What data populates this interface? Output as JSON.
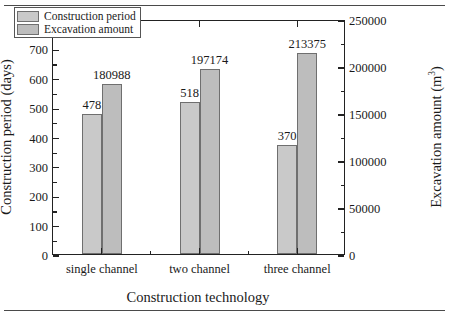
{
  "chart_data": {
    "type": "bar",
    "title": "",
    "xlabel": "Construction technology",
    "categories": [
      "single channel",
      "two channel",
      "three channel"
    ],
    "series": [
      {
        "name": "Construction period",
        "unit": "days",
        "axis": "left",
        "color": "#c9c9c9",
        "values": [
          478,
          518,
          370
        ],
        "labels": [
          "478",
          "518",
          "370"
        ]
      },
      {
        "name": "Excavation amount",
        "unit": "m3",
        "axis": "right",
        "color": "#bdbdbd",
        "values": [
          180988,
          197174,
          213375
        ],
        "labels": [
          "180988",
          "197174",
          "213375"
        ]
      }
    ],
    "left_axis": {
      "label": "Construction period (days)",
      "ylim": [
        0,
        800
      ],
      "ticks": [
        0,
        100,
        200,
        300,
        400,
        500,
        600,
        700,
        800
      ],
      "tick_labels": [
        "0",
        "100",
        "200",
        "300",
        "400",
        "500",
        "600",
        "700",
        "800"
      ],
      "minor_ticks": [
        50,
        150,
        250,
        350,
        450,
        550,
        650,
        750
      ]
    },
    "right_axis": {
      "label_main": "Excavation amount (m",
      "label_sup": "3",
      "label_tail": ")",
      "label_plain": "Excavation amount (m3)",
      "ylim": [
        0,
        250000
      ],
      "ticks": [
        0,
        50000,
        100000,
        150000,
        200000,
        250000
      ],
      "tick_labels": [
        "0",
        "50000",
        "100000",
        "150000",
        "200000",
        "250000"
      ],
      "minor_ticks": [
        25000,
        75000,
        125000,
        175000,
        225000
      ]
    },
    "grid": false,
    "legend": {
      "position": "top-left-inside",
      "entries": [
        "Construction period",
        "Excavation amount"
      ]
    }
  }
}
